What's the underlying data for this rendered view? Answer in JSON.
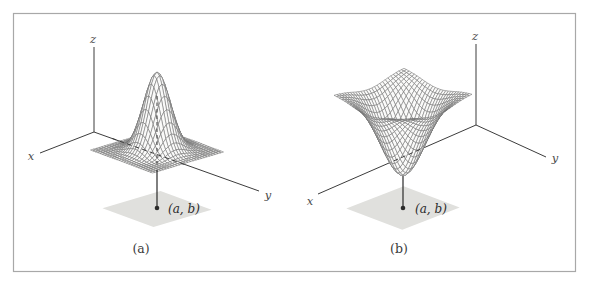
{
  "figure": {
    "kind": "textbook figure: two 3D wireframe surface plots over a shaded square region in the xy-plane",
    "background": "#ffffff",
    "border_color": "#a8a8a8"
  },
  "chart_data": [
    {
      "type": "surface",
      "caption": "(a)",
      "surface_shape": "peak",
      "description": "Wireframe mesh surface z = f(x,y) with a local maximum (sharp peak) directly above the point (a, b); dashed segments show hidden parts of the y-axis and the vertical line through the peak",
      "axes": {
        "x": "x",
        "y": "y",
        "z": "z"
      },
      "critical_point_label": "(a, b)",
      "region": "shaded square (rhombus in perspective) in the xy-plane centered at (a, b)",
      "grid": "24-28 mesh lines per direction",
      "legend": "none",
      "tick_labels": "none"
    },
    {
      "type": "surface",
      "caption": "(b)",
      "surface_shape": "pit",
      "description": "Wireframe mesh surface z = f(x,y) with a local minimum (funnel-shaped dip) directly above the point (a, b); a dashed segment shows the x-axis hidden behind the funnel",
      "axes": {
        "x": "x",
        "y": "y",
        "z": "z"
      },
      "critical_point_label": "(a, b)",
      "region": "shaded square (rhombus in perspective) in the xy-plane centered at (a, b)",
      "grid": "24-28 mesh lines per direction",
      "legend": "none",
      "tick_labels": "none"
    }
  ],
  "style": {
    "mesh_stroke": "#6f6f6f",
    "mesh_fill": "#fafaf9",
    "axis_color": "#3c3c3c",
    "region_fill": "#e0e0dd",
    "point_color": "#2b2b2b",
    "label_color": "#2b2b2b",
    "border_color": "#a8a8a8"
  }
}
